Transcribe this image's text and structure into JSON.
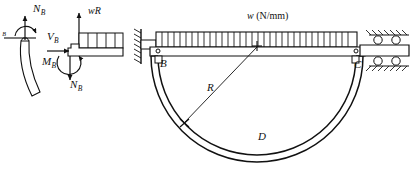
{
  "figure": {
    "stroke_color": "#111111",
    "background": "#ffffff"
  },
  "fbd_left": {
    "name": "left-free-body-diagram",
    "normal_force_label": "N",
    "normal_force_sub": "B",
    "moment_label": "",
    "partial_label": "B",
    "member": "curved-beam-segment"
  },
  "fbd_middle": {
    "name": "middle-free-body-diagram",
    "resultant_load_label": "wR",
    "shear_label": "V",
    "shear_sub": "B",
    "moment_label": "M",
    "moment_sub": "B",
    "normal_label": "N",
    "normal_sub": "B",
    "distributed_load_segments": 5
  },
  "arch": {
    "name": "semicircular-arch-assembly",
    "load_label_symbol": "w",
    "load_label_units": " (N/mm)",
    "point_b": "B",
    "point_c": "C",
    "point_d": "D",
    "radius_label": "R",
    "left_support": "fixed-pin-wall",
    "right_support": "roller-support",
    "distributed_load_ticks": 33,
    "center_marker": "+"
  }
}
